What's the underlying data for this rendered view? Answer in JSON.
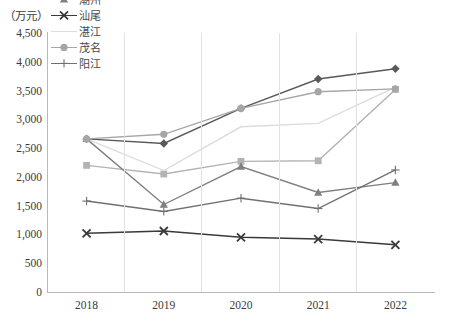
{
  "unit_label": "（万元）",
  "chart_data": {
    "type": "line",
    "title": "",
    "xlabel": "",
    "ylabel": "（万元）",
    "categories": [
      "2018",
      "2019",
      "2020",
      "2021",
      "2022"
    ],
    "x": [
      2018,
      2019,
      2020,
      2021,
      2022
    ],
    "ylim": [
      0,
      4500
    ],
    "ytick_labels": [
      "0",
      "500",
      "1,000",
      "1,500",
      "2,000",
      "2,500",
      "3,000",
      "3,500",
      "4,000",
      "4,500"
    ],
    "yticks": [
      0,
      500,
      1000,
      1500,
      2000,
      2500,
      3000,
      3500,
      4000,
      4500
    ],
    "grid": "vertical",
    "legend_position": "top",
    "series": [
      {
        "name": "汕头",
        "marker": "diamond",
        "color": "#595959",
        "values": [
          2660,
          2580,
          3190,
          3700,
          3880
        ]
      },
      {
        "name": "揭阳",
        "marker": "square",
        "color": "#b3b3b3",
        "values": [
          2200,
          2050,
          2270,
          2280,
          3520
        ]
      },
      {
        "name": "潮州",
        "marker": "triangle",
        "color": "#808080",
        "values": [
          2660,
          1520,
          2180,
          1730,
          1900
        ]
      },
      {
        "name": "汕尾",
        "marker": "x",
        "color": "#3a3a3a",
        "values": [
          1020,
          1060,
          950,
          920,
          820
        ]
      },
      {
        "name": "湛江",
        "marker": "none",
        "color": "#dcdcdc",
        "values": [
          2660,
          2110,
          2870,
          2930,
          3560
        ]
      },
      {
        "name": "茂名",
        "marker": "circle",
        "color": "#a6a6a6",
        "values": [
          2660,
          2740,
          3190,
          3480,
          3530
        ]
      },
      {
        "name": "阳江",
        "marker": "plus",
        "color": "#707070",
        "values": [
          1580,
          1400,
          1630,
          1450,
          2120
        ]
      }
    ]
  }
}
